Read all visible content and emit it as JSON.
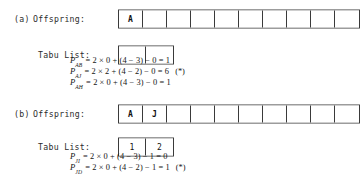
{
  "figure": {
    "panels": [
      {
        "tag": "(a)",
        "offspring_label": "Offspring:",
        "tabu_label": "Tabu List:",
        "offspring_cells": [
          "A",
          "",
          "",
          "",
          "",
          "",
          "",
          "",
          "",
          ""
        ],
        "tabu_cells": [
          "",
          ""
        ],
        "formulas": [
          {
            "symbol": "P",
            "subscript": "AB",
            "body": "= 2 × 0 + (4 − 3) − 0 = 1",
            "marker": ""
          },
          {
            "symbol": "P",
            "subscript": "AJ",
            "body": "= 2 × 2 + (4 − 2) − 0 = 6",
            "marker": "(*)"
          },
          {
            "symbol": "P",
            "subscript": "AH",
            "body": "= 2 × 0 + (4 − 3) − 0 = 1",
            "marker": ""
          }
        ]
      },
      {
        "tag": "(b)",
        "offspring_label": "Offspring:",
        "tabu_label": "Tabu List:",
        "offspring_cells": [
          "A",
          "J",
          "",
          "",
          "",
          "",
          "",
          "",
          "",
          ""
        ],
        "tabu_cells": [
          "1",
          "2"
        ],
        "formulas": [
          {
            "symbol": "P",
            "subscript": "JI",
            "body": "= 2 × 0 + (4 − 3) − 1 = 0",
            "marker": ""
          },
          {
            "symbol": "P",
            "subscript": "JD",
            "body": "= 2 × 0 + (4 − 2) − 1 = 1",
            "marker": "(*)"
          }
        ]
      }
    ]
  }
}
